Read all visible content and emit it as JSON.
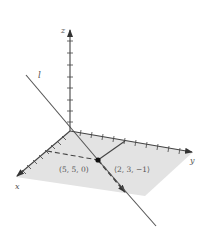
{
  "figure": {
    "type": "3d-coordinate-diagram",
    "axes": {
      "x_label": "x",
      "y_label": "y",
      "z_label": "z",
      "z_tick_count": 8,
      "x_tick_count": 9,
      "y_tick_count": 11
    },
    "plane": {
      "description": "xy-plane",
      "color": "#e3e3e3"
    },
    "line": {
      "label": "l",
      "color": "#555555"
    },
    "point": {
      "label": "(5, 5, 0)"
    },
    "direction_vector": {
      "label": "⟨2, 3, −1⟩"
    },
    "colors": {
      "axis": "#444444",
      "text": "#555555",
      "plane": "#e3e3e3",
      "point": "#111111"
    }
  }
}
